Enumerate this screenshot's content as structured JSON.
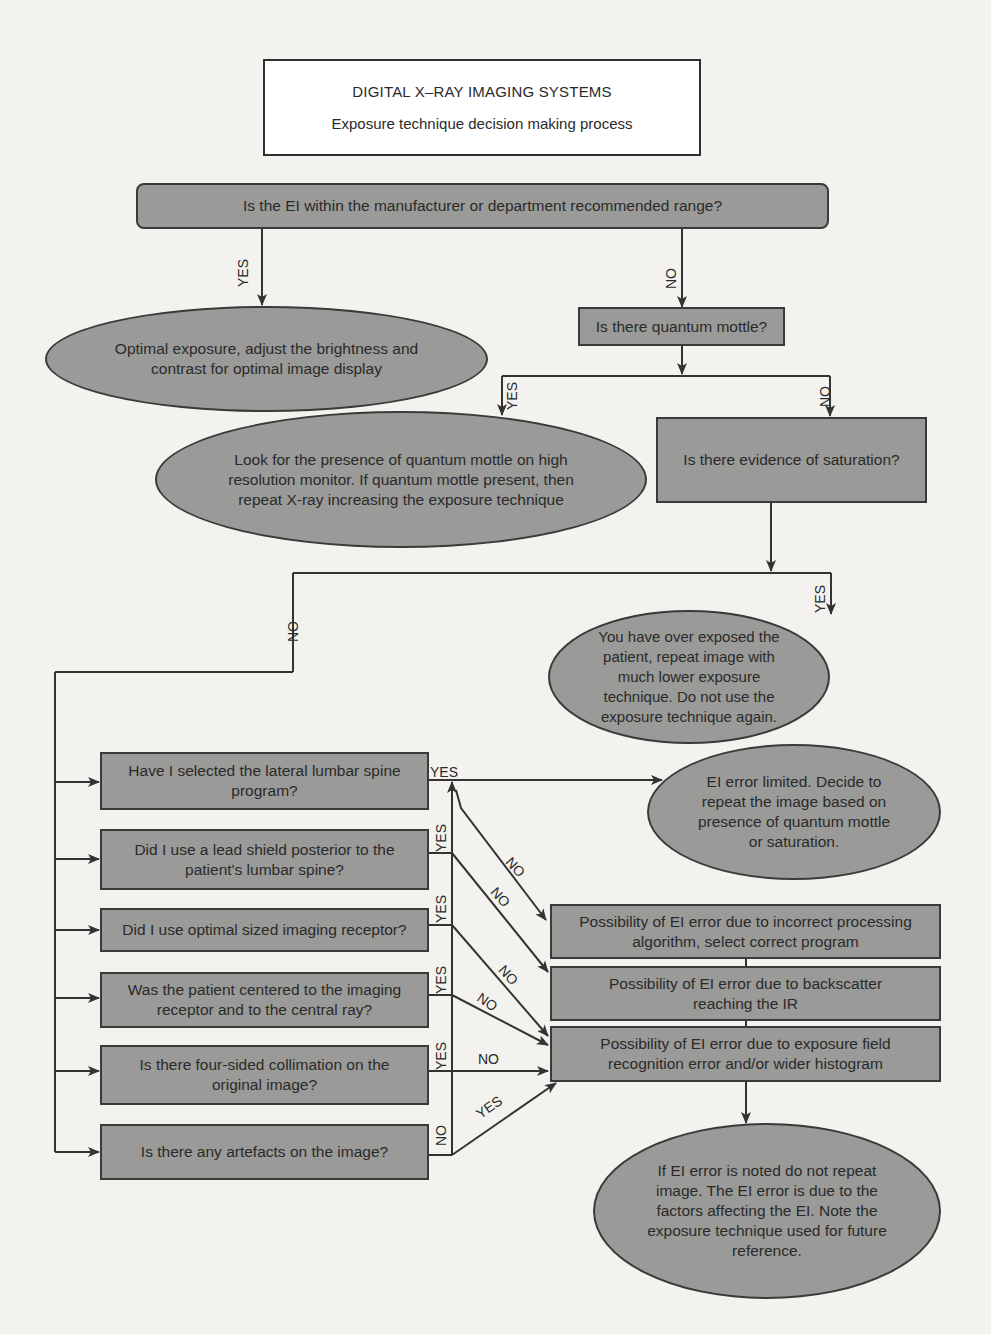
{
  "header": {
    "title": "DIGITAL X–RAY  IMAGING SYSTEMS",
    "subtitle": "Exposure technique decision making process"
  },
  "nodes": {
    "q_ei_range": "Is the EI within the manufacturer or department recommended range?",
    "optimal_exposure": "Optimal exposure, adjust the brightness and contrast for optimal image display",
    "q_quantum_mottle": "Is there quantum mottle?",
    "look_for_mottle": "Look for the presence of quantum mottle on high resolution monitor. If quantum mottle present, then repeat X-ray increasing the exposure technique",
    "q_saturation": "Is there evidence of saturation?",
    "over_exposed": "You have over exposed the patient, repeat image with much lower exposure technique. Do not use the exposure technique again.",
    "q_lumbar_program": "Have I selected the lateral lumbar spine program?",
    "q_lead_shield": "Did I use a lead shield posterior to the patient's lumbar spine?",
    "q_receptor_size": "Did I use optimal sized imaging receptor?",
    "q_centered": "Was the patient centered to the imaging receptor and to the central ray?",
    "q_collimation": "Is there four-sided collimation on the original image?",
    "q_artefacts": "Is there any artefacts on the image?",
    "ei_error_limited": "EI error limited. Decide to repeat the image based on presence of quantum mottle or saturation.",
    "err_processing": "Possibility of EI error due to incorrect processing algorithm, select correct program",
    "err_backscatter": "Possibility of EI error due to backscatter reaching the IR",
    "err_exposure_field": "Possibility of EI error due to exposure field recognition error and/or wider histogram",
    "final_note": "If EI error is noted do not repeat image. The EI error is due to the factors affecting the EI. Note the exposure technique used for future reference."
  },
  "labels": {
    "yes": "YES",
    "no": "NO"
  },
  "colors": {
    "node_fill": "#9a9a98",
    "stroke": "#3a3a3a",
    "background": "#f3f2ee",
    "title_fill": "#ffffff"
  }
}
